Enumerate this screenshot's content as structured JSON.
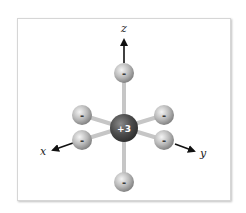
{
  "diagram": {
    "central_ion": {
      "label": "+3",
      "color": "#4a4a4a"
    },
    "ligand_label": "-",
    "ligand_color": "#b8b8b8",
    "bond_color": "#c4c4c4",
    "axes": {
      "x": {
        "label": "x"
      },
      "y": {
        "label": "y"
      },
      "z": {
        "label": "z"
      }
    },
    "ligands": [
      {
        "position": "top",
        "charge": "-"
      },
      {
        "position": "upper-left",
        "charge": "-"
      },
      {
        "position": "upper-right",
        "charge": "-"
      },
      {
        "position": "lower-left",
        "charge": "-"
      },
      {
        "position": "lower-right",
        "charge": "-"
      },
      {
        "position": "bottom",
        "charge": "-"
      }
    ]
  }
}
